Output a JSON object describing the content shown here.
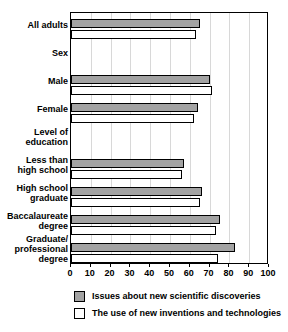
{
  "chart_data": {
    "type": "bar",
    "orientation": "horizontal",
    "title": "",
    "xlabel": "",
    "ylabel": "",
    "xlim": [
      0,
      100
    ],
    "xticks": [
      0,
      10,
      20,
      30,
      40,
      50,
      60,
      70,
      80,
      90,
      100
    ],
    "grid": true,
    "legend_position": "bottom",
    "categories": [
      "All adults",
      "Sex",
      "Male",
      "Female",
      "Level of education",
      "Less than high school",
      "High school graduate",
      "Baccalaureate degree",
      "Graduate/professional degree"
    ],
    "category_labels": [
      [
        "All adults"
      ],
      [
        "Sex"
      ],
      [
        "Male"
      ],
      [
        "Female"
      ],
      [
        "Level of",
        "education"
      ],
      [
        "Less than",
        "high school"
      ],
      [
        "High school",
        "graduate"
      ],
      [
        "Baccalaureate",
        "degree"
      ],
      [
        "Graduate/",
        "professional",
        "degree"
      ]
    ],
    "group_headers": [
      "Sex",
      "Level of education"
    ],
    "series": [
      {
        "name": "Issues about new scientific discoveries",
        "color": "#a3a3a3",
        "values": [
          65,
          null,
          70,
          64,
          null,
          57,
          66,
          75,
          83
        ]
      },
      {
        "name": "The use of new inventions and technologies",
        "color": "#ffffff",
        "values": [
          63,
          null,
          71,
          62,
          null,
          56,
          65,
          73,
          74
        ]
      }
    ]
  },
  "legend": {
    "items": [
      {
        "label": "Issues about new scientific discoveries",
        "swatch": "gray"
      },
      {
        "label": "The use of new inventions and technologies",
        "swatch": "white"
      }
    ]
  },
  "colors": {
    "series_gray": "#a3a3a3",
    "series_white": "#ffffff",
    "axis": "#000000",
    "grid": "#d8d8d8",
    "background": "#ffffff"
  }
}
